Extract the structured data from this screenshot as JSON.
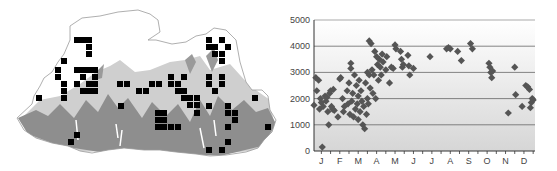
{
  "map": {
    "title": "",
    "outline_color": "#9a9a9a",
    "terrain_colors": {
      "low": "#8c8c8c",
      "mid": "#c8c8c8",
      "high": "#ffffff"
    },
    "marker_color": "#000000",
    "grid_squares": [
      [
        77,
        40
      ],
      [
        83,
        40
      ],
      [
        89,
        40
      ],
      [
        89,
        47
      ],
      [
        89,
        54
      ],
      [
        64,
        61
      ],
      [
        58,
        70
      ],
      [
        77,
        70
      ],
      [
        83,
        70
      ],
      [
        89,
        70
      ],
      [
        95,
        70
      ],
      [
        58,
        77
      ],
      [
        83,
        77
      ],
      [
        95,
        77
      ],
      [
        64,
        84
      ],
      [
        77,
        84
      ],
      [
        89,
        84
      ],
      [
        95,
        84
      ],
      [
        64,
        91
      ],
      [
        83,
        91
      ],
      [
        89,
        91
      ],
      [
        95,
        91
      ],
      [
        64,
        98
      ],
      [
        39,
        98
      ],
      [
        120,
        84
      ],
      [
        127,
        84
      ],
      [
        152,
        84
      ],
      [
        159,
        84
      ],
      [
        139,
        91
      ],
      [
        146,
        91
      ],
      [
        171,
        77
      ],
      [
        184,
        77
      ],
      [
        171,
        84
      ],
      [
        178,
        84
      ],
      [
        178,
        91
      ],
      [
        184,
        91
      ],
      [
        184,
        98
      ],
      [
        190,
        98
      ],
      [
        197,
        98
      ],
      [
        190,
        105
      ],
      [
        197,
        105
      ],
      [
        197,
        113
      ],
      [
        121,
        106
      ],
      [
        158,
        113
      ],
      [
        164,
        113
      ],
      [
        158,
        120
      ],
      [
        164,
        120
      ],
      [
        158,
        127
      ],
      [
        164,
        127
      ],
      [
        171,
        127
      ],
      [
        178,
        127
      ],
      [
        77,
        135
      ],
      [
        71,
        142
      ],
      [
        209,
        40
      ],
      [
        222,
        40
      ],
      [
        209,
        47
      ],
      [
        215,
        47
      ],
      [
        228,
        47
      ],
      [
        215,
        54
      ],
      [
        222,
        54
      ],
      [
        222,
        61
      ],
      [
        209,
        77
      ],
      [
        222,
        77
      ],
      [
        209,
        84
      ],
      [
        222,
        84
      ],
      [
        215,
        91
      ],
      [
        255,
        98
      ],
      [
        209,
        106
      ],
      [
        228,
        106
      ],
      [
        228,
        113
      ],
      [
        235,
        113
      ],
      [
        235,
        120
      ],
      [
        228,
        127
      ],
      [
        268,
        127
      ],
      [
        228,
        142
      ],
      [
        209,
        150
      ],
      [
        222,
        150
      ]
    ]
  },
  "chart_data": {
    "type": "scatter",
    "title": "",
    "xlabel": "",
    "ylabel": "",
    "x_ticks": [
      "J",
      "F",
      "M",
      "A",
      "M",
      "J",
      "J",
      "A",
      "S",
      "O",
      "N",
      "D"
    ],
    "y_ticks": [
      0,
      1000,
      2000,
      3000,
      4000,
      5000
    ],
    "ylim": [
      0,
      5000
    ],
    "xlim": [
      0.6,
      12.6
    ],
    "grid": "horizontal",
    "marker": "diamond",
    "marker_color": "#555555",
    "background_gradient": [
      "#ffffff",
      "#d8d8d8"
    ],
    "points": [
      [
        0.6,
        1750
      ],
      [
        0.7,
        2800
      ],
      [
        0.75,
        2300
      ],
      [
        0.85,
        2700
      ],
      [
        0.9,
        1600
      ],
      [
        0.95,
        2000
      ],
      [
        1.0,
        1850
      ],
      [
        1.05,
        150
      ],
      [
        1.1,
        1700
      ],
      [
        1.2,
        2100
      ],
      [
        1.25,
        1900
      ],
      [
        1.3,
        2050
      ],
      [
        1.35,
        1500
      ],
      [
        1.4,
        1000
      ],
      [
        1.45,
        2200
      ],
      [
        1.5,
        2300
      ],
      [
        1.55,
        1700
      ],
      [
        1.6,
        1600
      ],
      [
        1.65,
        2350
      ],
      [
        1.7,
        1550
      ],
      [
        1.9,
        1300
      ],
      [
        2.0,
        2750
      ],
      [
        2.05,
        2800
      ],
      [
        2.15,
        2000
      ],
      [
        2.2,
        1500
      ],
      [
        2.25,
        1700
      ],
      [
        2.4,
        2300
      ],
      [
        2.45,
        1800
      ],
      [
        2.5,
        2600
      ],
      [
        2.55,
        1400
      ],
      [
        2.6,
        3350
      ],
      [
        2.6,
        3150
      ],
      [
        2.65,
        1900
      ],
      [
        2.7,
        2200
      ],
      [
        2.75,
        1300
      ],
      [
        2.8,
        2900
      ],
      [
        2.85,
        1600
      ],
      [
        2.9,
        2500
      ],
      [
        2.95,
        1800
      ],
      [
        3.0,
        2100
      ],
      [
        3.0,
        1200
      ],
      [
        3.05,
        2700
      ],
      [
        3.1,
        1500
      ],
      [
        3.15,
        2300
      ],
      [
        3.2,
        1900
      ],
      [
        3.25,
        1000
      ],
      [
        3.3,
        1700
      ],
      [
        3.35,
        850
      ],
      [
        3.4,
        2600
      ],
      [
        3.45,
        1400
      ],
      [
        3.5,
        2000
      ],
      [
        3.5,
        3000
      ],
      [
        3.55,
        1800
      ],
      [
        3.6,
        2900
      ],
      [
        3.6,
        4200
      ],
      [
        3.65,
        2400
      ],
      [
        3.7,
        4100
      ],
      [
        3.75,
        3100
      ],
      [
        3.8,
        2200
      ],
      [
        3.85,
        2900
      ],
      [
        3.9,
        3800
      ],
      [
        3.95,
        2000
      ],
      [
        4.0,
        3600
      ],
      [
        4.05,
        3300
      ],
      [
        4.1,
        2700
      ],
      [
        4.15,
        3500
      ],
      [
        4.2,
        3200
      ],
      [
        4.25,
        2900
      ],
      [
        4.3,
        3700
      ],
      [
        4.35,
        3400
      ],
      [
        4.5,
        3100
      ],
      [
        4.55,
        3600
      ],
      [
        4.7,
        2600
      ],
      [
        4.8,
        3200
      ],
      [
        4.9,
        3150
      ],
      [
        5.0,
        4050
      ],
      [
        5.05,
        3900
      ],
      [
        5.3,
        3800
      ],
      [
        5.35,
        3500
      ],
      [
        5.4,
        3200
      ],
      [
        5.45,
        3300
      ],
      [
        5.7,
        3650
      ],
      [
        5.75,
        3250
      ],
      [
        5.8,
        2900
      ],
      [
        6.0,
        3150
      ],
      [
        6.9,
        3600
      ],
      [
        7.8,
        3900
      ],
      [
        7.9,
        3950
      ],
      [
        8.0,
        3900
      ],
      [
        8.4,
        3800
      ],
      [
        8.6,
        3450
      ],
      [
        9.1,
        4100
      ],
      [
        9.2,
        3900
      ],
      [
        10.1,
        3350
      ],
      [
        10.15,
        3200
      ],
      [
        10.2,
        3000
      ],
      [
        10.25,
        2800
      ],
      [
        10.3,
        3050
      ],
      [
        11.15,
        1450
      ],
      [
        11.5,
        3200
      ],
      [
        11.55,
        2150
      ],
      [
        11.9,
        1700
      ],
      [
        12.1,
        2500
      ],
      [
        12.2,
        2450
      ],
      [
        12.3,
        2350
      ],
      [
        12.35,
        1650
      ],
      [
        12.4,
        1850
      ],
      [
        12.45,
        2000
      ],
      [
        12.5,
        1950
      ]
    ]
  }
}
